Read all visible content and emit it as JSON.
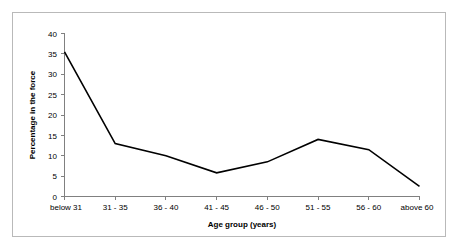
{
  "chart_data": {
    "type": "line",
    "title": "",
    "xlabel": "Age group (years)",
    "ylabel": "Percentage in the force",
    "categories": [
      "below 31",
      "31 - 35",
      "36 - 40",
      "41 - 45",
      "46 - 50",
      "51 - 55",
      "56 - 60",
      "above 60"
    ],
    "values": [
      35.5,
      13,
      10,
      5.8,
      8.5,
      14,
      11.5,
      2.5
    ],
    "series": [
      {
        "name": "Percentage in the force",
        "values": [
          35.5,
          13,
          10,
          5.8,
          8.5,
          14,
          11.5,
          2.5
        ]
      }
    ],
    "ylim": [
      0,
      40
    ],
    "ytick_values": [
      0,
      5,
      10,
      15,
      20,
      25,
      30,
      35,
      40
    ],
    "ytick_labels": [
      "0",
      "5",
      "10",
      "15",
      "20",
      "25",
      "30",
      "35",
      "40"
    ],
    "grid": false,
    "legend": "none",
    "line_color": "#000000",
    "axis_color": "#808080",
    "frame_color": "#b9b9b9",
    "background_color": "#ffffff"
  }
}
